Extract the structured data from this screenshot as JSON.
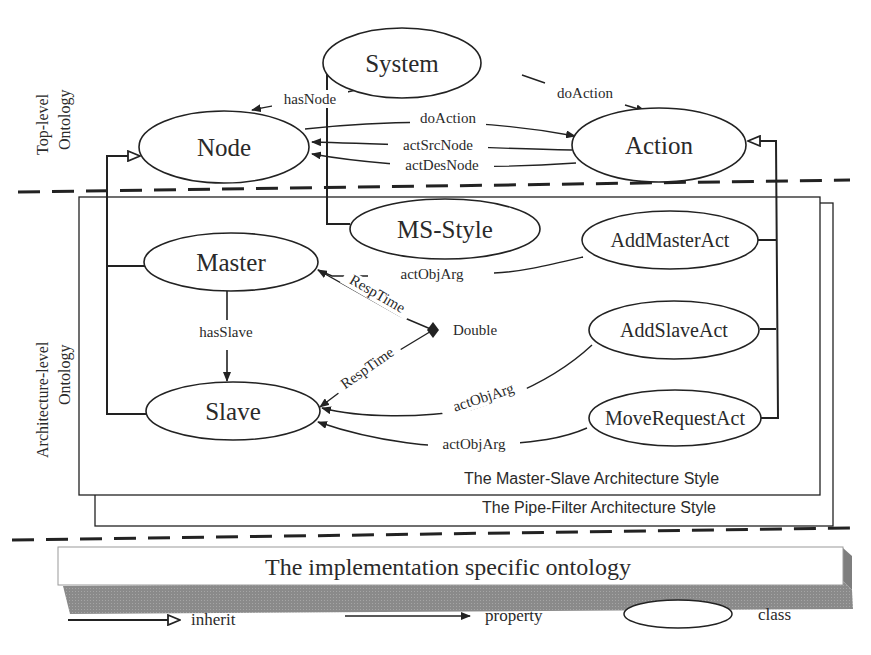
{
  "diagram": {
    "layers": {
      "top": {
        "label_line1": "Top-level",
        "label_line2": "Ontology"
      },
      "architecture": {
        "label_line1": "Architecture-level",
        "label_line2": "Ontology"
      }
    },
    "classes": {
      "system": "System",
      "node": "Node",
      "action": "Action",
      "ms_style": "MS-Style",
      "master": "Master",
      "slave": "Slave",
      "add_master_act": "AddMasterAct",
      "add_slave_act": "AddSlaveAct",
      "move_request_act": "MoveRequestAct"
    },
    "datatype": "Double",
    "properties": {
      "has_node": "hasNode",
      "system_do_action": "doAction",
      "node_do_action": "doAction",
      "act_src_node": "actSrcNode",
      "act_des_node": "actDesNode",
      "has_slave": "hasSlave",
      "master_resp_time": "RespTime",
      "slave_resp_time": "RespTime",
      "add_master_obj_arg": "actObjArg",
      "add_slave_obj_arg": "actObjArg",
      "move_request_obj_arg": "actObjArg"
    },
    "frames": {
      "master_slave": "The Master-Slave Architecture Style",
      "pipe_filter": "The Pipe-Filter Architecture Style"
    },
    "implementation_bar": "The implementation specific ontology",
    "legend": {
      "inherit": "inherit",
      "property": "property",
      "class": "class"
    }
  }
}
